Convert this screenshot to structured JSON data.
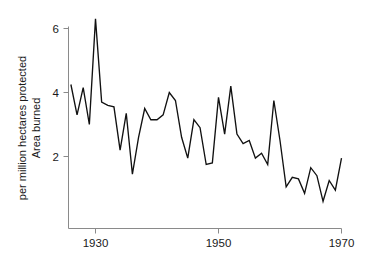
{
  "chart_data": {
    "type": "line",
    "title": "",
    "subtitle": "",
    "xlabel": "",
    "ylabel": "Area burned\nper million hectares protected",
    "ylabel_line1": "Area burned",
    "ylabel_line2": "per million hectares protected",
    "xlim": [
      1925.5,
      1970.0
    ],
    "ylim": [
      0.0,
      6.6
    ],
    "grid": false,
    "legend": null,
    "xticks": [
      1930,
      1950,
      1970
    ],
    "xticklabels": [
      "1930",
      "1950",
      "1970"
    ],
    "yticks": [
      2,
      4,
      6
    ],
    "yticklabels": [
      "2",
      "4",
      "6"
    ],
    "line_color": "#111111",
    "axis_color": "#8a8a8a",
    "background_color": "#ffffff",
    "series": [
      {
        "name": "Area burned per million hectares protected",
        "x": [
          1926,
          1927,
          1928,
          1929,
          1930,
          1931,
          1932,
          1933,
          1934,
          1935,
          1936,
          1937,
          1938,
          1939,
          1940,
          1941,
          1942,
          1943,
          1944,
          1945,
          1946,
          1947,
          1948,
          1949,
          1950,
          1951,
          1952,
          1953,
          1954,
          1955,
          1956,
          1957,
          1958,
          1959,
          1960,
          1961,
          1962,
          1963,
          1964,
          1965,
          1966,
          1967,
          1968,
          1969,
          1970
        ],
        "values": [
          4.25,
          3.3,
          4.15,
          3.0,
          6.3,
          3.7,
          3.6,
          3.55,
          2.2,
          3.35,
          1.45,
          2.6,
          3.5,
          3.15,
          3.15,
          3.3,
          4.0,
          3.75,
          2.6,
          1.95,
          3.15,
          2.9,
          1.75,
          1.8,
          3.85,
          2.7,
          4.2,
          2.7,
          2.4,
          2.5,
          1.95,
          2.1,
          1.75,
          3.75,
          2.5,
          1.05,
          1.35,
          1.3,
          0.85,
          1.65,
          1.4,
          0.6,
          1.25,
          0.95,
          1.95
        ]
      }
    ]
  },
  "axes": {
    "y_tick_2": "2",
    "y_tick_4": "4",
    "y_tick_6": "6",
    "x_tick_1930": "1930",
    "x_tick_1950": "1950",
    "x_tick_1970": "1970",
    "ylabel_line1": "Area burned",
    "ylabel_line2": "per million hectares protected"
  }
}
